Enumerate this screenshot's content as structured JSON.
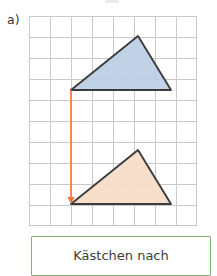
{
  "page": {
    "part_label": "a)",
    "background_color": "#ffffff"
  },
  "grid": {
    "origin_x": 29,
    "origin_y": 16,
    "cell_size": 21,
    "columns": 8,
    "rows": 10,
    "line_color": "#c9c9c9",
    "border_color": "#bdbdbd"
  },
  "figures": {
    "original": {
      "name": "blue-triangle",
      "fill_color": "#bed0e6",
      "stroke_color": "#3c3c3c",
      "points": "42,74 109,20 142,74",
      "vertices": [
        {
          "x": 42,
          "y": 74
        },
        {
          "x": 109,
          "y": 20
        },
        {
          "x": 142,
          "y": 74
        }
      ]
    },
    "image": {
      "name": "orange-triangle",
      "fill_color": "#f7ddc9",
      "stroke_color": "#3c3c3c",
      "points": "42,188 109,134 142,188",
      "vertices": [
        {
          "x": 42,
          "y": 188
        },
        {
          "x": 109,
          "y": 134
        },
        {
          "x": 142,
          "y": 188
        }
      ]
    }
  },
  "translation_arrow": {
    "name": "translation-arrow",
    "color": "#f4743b",
    "start_x": 42,
    "start_y": 74,
    "end_x": 42,
    "end_y": 188,
    "direction": "down",
    "cells_moved": 6
  },
  "answer_box": {
    "text": "Kästchen nach",
    "border_color": "#85b178",
    "background_color": "#ffffff"
  }
}
